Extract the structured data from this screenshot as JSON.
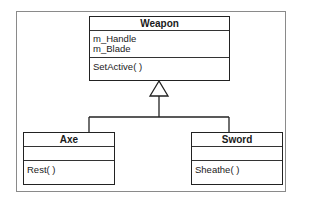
{
  "diagram": {
    "type": "uml-class-diagram",
    "classes": {
      "weapon": {
        "name": "Weapon",
        "attributes": [
          "m_Handle",
          "m_Blade"
        ],
        "methods": [
          "SetActive( )"
        ]
      },
      "axe": {
        "name": "Axe",
        "attributes": [],
        "methods": [
          "Rest( )"
        ]
      },
      "sword": {
        "name": "Sword",
        "attributes": [],
        "methods": [
          "Sheathe( )"
        ]
      }
    },
    "relationships": [
      {
        "type": "generalization",
        "from": "Axe",
        "to": "Weapon"
      },
      {
        "type": "generalization",
        "from": "Sword",
        "to": "Weapon"
      }
    ]
  }
}
